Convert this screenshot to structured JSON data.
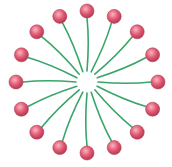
{
  "diagram": {
    "title": "",
    "kind": "micelle",
    "molecule_count": 16,
    "head_color": "#e35a74",
    "head_highlight": "#f7b6c2",
    "head_outline": "#b23a52",
    "tail_color": "#3aa56a",
    "background": "#ffffff",
    "labels": []
  }
}
